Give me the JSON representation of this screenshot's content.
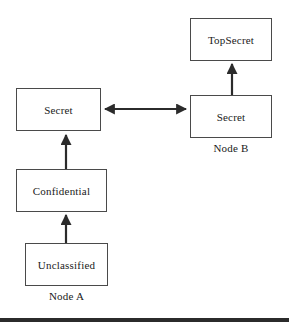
{
  "diagram": {
    "background_color": "#ffffff",
    "box_border_color": "#4a4a4a",
    "text_color": "#1a1a1a",
    "arrow_color": "#2b2b2b",
    "width": 289,
    "height": 324,
    "nodes": [
      {
        "id": "topsecret",
        "label": "TopSecret",
        "group": "Node B",
        "x": 190,
        "y": 18,
        "w": 82,
        "h": 43
      },
      {
        "id": "secret_b",
        "label": "Secret",
        "group": "Node B",
        "x": 190,
        "y": 95,
        "w": 82,
        "h": 43
      },
      {
        "id": "secret_a",
        "label": "Secret",
        "group": "Node A",
        "x": 16,
        "y": 88,
        "w": 85,
        "h": 43
      },
      {
        "id": "confidential",
        "label": "Confidential",
        "group": "Node A",
        "x": 16,
        "y": 169,
        "w": 91,
        "h": 43
      },
      {
        "id": "unclassified",
        "label": "Unclassified",
        "group": "Node A",
        "x": 25,
        "y": 243,
        "w": 83,
        "h": 43
      }
    ],
    "group_labels": [
      {
        "id": "node_a",
        "label": "Node A"
      },
      {
        "id": "node_b",
        "label": "Node B"
      }
    ],
    "edges": [
      {
        "id": "unclassified_to_confidential",
        "from": "unclassified",
        "to": "confidential",
        "direction": "up",
        "arrowheads": 1
      },
      {
        "id": "confidential_to_secret_a",
        "from": "confidential",
        "to": "secret_a",
        "direction": "up",
        "arrowheads": 1
      },
      {
        "id": "secret_b_to_topsecret",
        "from": "secret_b",
        "to": "topsecret",
        "direction": "up",
        "arrowheads": 1
      },
      {
        "id": "secret_a_to_secret_b",
        "from": "secret_a",
        "to": "secret_b",
        "direction": "bidirectional",
        "arrowheads": 2
      }
    ]
  }
}
